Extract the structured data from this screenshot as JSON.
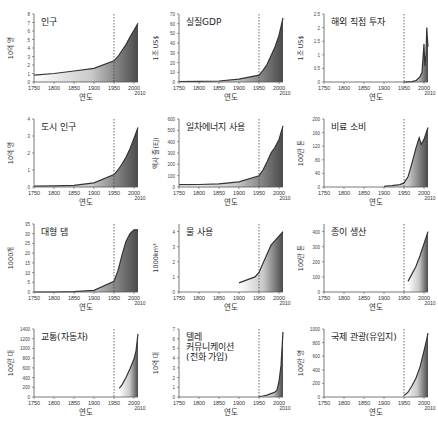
{
  "xlabel": "연도",
  "x_ticks": [
    "1750",
    "1800",
    "1850",
    "1900",
    "1950",
    "2000"
  ],
  "x_extra_tick": "2010",
  "chart_data": [
    {
      "type": "area",
      "title": "인구",
      "ylabel": "10억 명",
      "ylim": [
        0,
        8
      ],
      "y_ticks": [
        0,
        1,
        2,
        3,
        4,
        5,
        6,
        7,
        8
      ],
      "x": [
        1750,
        1800,
        1850,
        1900,
        1950,
        1960,
        1970,
        1980,
        1990,
        2000,
        2010
      ],
      "values": [
        0.8,
        1.0,
        1.3,
        1.6,
        2.5,
        3.0,
        3.7,
        4.4,
        5.3,
        6.1,
        6.9
      ],
      "marker_year": 1950
    },
    {
      "type": "area",
      "title": "실질GDP",
      "ylabel": "1조 US$",
      "ylim": [
        0,
        70
      ],
      "y_ticks": [
        0,
        10,
        20,
        30,
        40,
        50,
        60,
        70
      ],
      "x": [
        1750,
        1800,
        1850,
        1900,
        1950,
        1960,
        1970,
        1980,
        1990,
        2000,
        2010
      ],
      "values": [
        0.5,
        0.7,
        1,
        3,
        7,
        12,
        18,
        27,
        36,
        48,
        66
      ],
      "marker_year": 1950
    },
    {
      "type": "area",
      "title": "해외 직접 투자",
      "ylabel": "1조 US$",
      "ylim": [
        0,
        2.5
      ],
      "y_ticks": [
        0,
        0.5,
        1,
        1.5,
        2,
        2.5
      ],
      "x": [
        1950,
        1970,
        1980,
        1990,
        1995,
        2000,
        2002,
        2005,
        2007,
        2008,
        2010
      ],
      "values": [
        0,
        0.01,
        0.05,
        0.2,
        0.35,
        1.4,
        0.6,
        1.0,
        2.0,
        1.7,
        1.3
      ],
      "marker_year": 1950
    },
    {
      "type": "area",
      "title": "도시 인구",
      "ylabel": "10억 명",
      "ylim": [
        0,
        4
      ],
      "y_ticks": [
        0,
        1,
        2,
        3,
        4
      ],
      "x": [
        1750,
        1800,
        1850,
        1900,
        1950,
        1960,
        1970,
        1980,
        1990,
        2000,
        2010
      ],
      "values": [
        0.05,
        0.07,
        0.1,
        0.25,
        0.73,
        1.0,
        1.35,
        1.75,
        2.25,
        2.85,
        3.5
      ],
      "marker_year": 1950
    },
    {
      "type": "area",
      "title": "일차에너지 사용",
      "ylabel": "엑사 줄(EJ)",
      "ylim": [
        0,
        600
      ],
      "y_ticks": [
        0,
        100,
        200,
        300,
        400,
        500,
        600
      ],
      "x": [
        1750,
        1800,
        1850,
        1900,
        1950,
        1960,
        1970,
        1980,
        1990,
        2000,
        2010
      ],
      "values": [
        20,
        22,
        28,
        45,
        100,
        150,
        220,
        300,
        350,
        420,
        540
      ],
      "marker_year": 1950
    },
    {
      "type": "area",
      "title": "비료 소비",
      "ylabel": "100만 톤",
      "ylim": [
        0,
        200
      ],
      "y_ticks": [
        0,
        40,
        80,
        120,
        160,
        200
      ],
      "x": [
        1900,
        1920,
        1940,
        1950,
        1960,
        1970,
        1980,
        1988,
        1993,
        2000,
        2010
      ],
      "values": [
        2,
        4,
        7,
        12,
        30,
        70,
        115,
        145,
        125,
        140,
        175
      ],
      "marker_year": 1950
    },
    {
      "type": "area",
      "title": "대형 댐",
      "ylabel": "1000개",
      "ylim": [
        0,
        35
      ],
      "y_ticks": [
        0,
        5,
        10,
        15,
        20,
        25,
        30,
        35
      ],
      "x": [
        1750,
        1800,
        1850,
        1900,
        1950,
        1960,
        1970,
        1980,
        1990,
        2000,
        2010
      ],
      "values": [
        0,
        0,
        0.2,
        0.8,
        5.5,
        11,
        19,
        26,
        30,
        32,
        32
      ],
      "marker_year": 1950
    },
    {
      "type": "area",
      "title": "물 사용",
      "ylabel": "1000km³",
      "ylim": [
        0,
        4.5
      ],
      "y_ticks": [
        0,
        1,
        2,
        3,
        4
      ],
      "x": [
        1900,
        1920,
        1940,
        1950,
        1960,
        1970,
        1980,
        1990,
        2000,
        2010
      ],
      "values": [
        0.6,
        0.8,
        1.0,
        1.3,
        1.9,
        2.5,
        3.1,
        3.4,
        3.7,
        4.0
      ],
      "marker_year": 1950
    },
    {
      "type": "area",
      "title": "종이 생산",
      "ylabel": "100만 톤",
      "ylim": [
        0,
        450
      ],
      "y_ticks": [
        0,
        100,
        200,
        300,
        400
      ],
      "x": [
        1960,
        1970,
        1980,
        1990,
        2000,
        2010
      ],
      "values": [
        70,
        120,
        170,
        240,
        320,
        400
      ],
      "marker_year": 1950
    },
    {
      "type": "area",
      "title": "교통(자동차)",
      "ylabel": "100만 대",
      "ylim": [
        0,
        1400
      ],
      "y_ticks": [
        0,
        200,
        400,
        600,
        800,
        1000,
        1200,
        1400
      ],
      "x": [
        1963,
        1970,
        1980,
        1990,
        2000,
        2005,
        2010
      ],
      "values": [
        180,
        250,
        400,
        580,
        780,
        950,
        1300
      ],
      "marker_year": 1950
    },
    {
      "type": "area",
      "title": "텔레 커뮤니케이션 (전화 가입)",
      "title_lines": [
        "텔레",
        "커뮤니케이션",
        "(전화 가입)"
      ],
      "ylabel": "10억 대",
      "ylim": [
        0,
        7
      ],
      "y_ticks": [
        0,
        1,
        2,
        3,
        4,
        5,
        6,
        7
      ],
      "x": [
        1950,
        1960,
        1970,
        1980,
        1990,
        1995,
        2000,
        2005,
        2010
      ],
      "values": [
        0.05,
        0.1,
        0.2,
        0.35,
        0.5,
        0.7,
        1.6,
        3.2,
        6.7
      ],
      "marker_year": 1950
    },
    {
      "type": "area",
      "title": "국제 관광(유입지)",
      "ylabel": "100만 명",
      "ylim": [
        0,
        1000
      ],
      "y_ticks": [
        0,
        200,
        400,
        600,
        800,
        1000
      ],
      "x": [
        1950,
        1955,
        1960,
        1970,
        1980,
        1990,
        2000,
        2005,
        2010
      ],
      "values": [
        25,
        45,
        70,
        165,
        280,
        440,
        680,
        800,
        940
      ],
      "marker_year": 1950
    }
  ]
}
